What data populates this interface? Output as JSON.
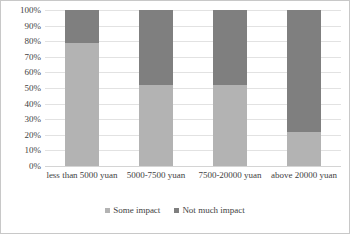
{
  "chart_data": {
    "type": "bar",
    "subtype": "100% stacked column",
    "title": "",
    "subtitle": "",
    "xlabel": "",
    "ylabel": "",
    "categories": [
      "less than 5000 yuan",
      "5000-7500 yuan",
      "7500-20000 yuan",
      "above 20000 yuan"
    ],
    "series": [
      {
        "name": "Some impact",
        "values": [
          79,
          52,
          52,
          22
        ],
        "color": "#b3b3b3"
      },
      {
        "name": "Not much impact",
        "values": [
          21,
          48,
          48,
          78
        ],
        "color": "#7f7f7f"
      }
    ],
    "ylim": [
      0,
      100
    ],
    "ytick_labels": [
      "0%",
      "10%",
      "20%",
      "30%",
      "40%",
      "50%",
      "60%",
      "70%",
      "80%",
      "90%",
      "100%"
    ],
    "ytick_values": [
      0,
      10,
      20,
      30,
      40,
      50,
      60,
      70,
      80,
      90,
      100
    ],
    "grid": true,
    "grid_axis": "y",
    "legend_position": "bottom",
    "units": "percent",
    "stack_order": "bottom-to-top"
  },
  "legend": {
    "items": [
      {
        "label": "Some impact",
        "color": "#b3b3b3"
      },
      {
        "label": "Not much impact",
        "color": "#7f7f7f"
      }
    ]
  },
  "colors": {
    "some_impact": "#b3b3b3",
    "not_much_impact": "#7f7f7f",
    "gridline": "#e2e2e2",
    "text": "#3f3f3f",
    "frame": "#c8c8c8"
  }
}
